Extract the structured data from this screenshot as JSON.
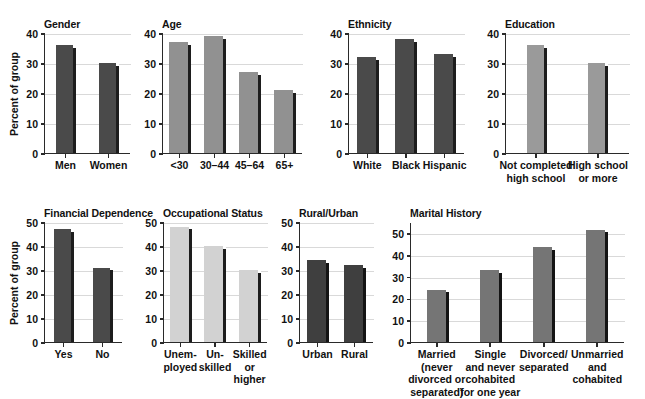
{
  "chart_data": [
    {
      "type": "bar",
      "title": "Gender",
      "xlabel": "",
      "ylabel": "Percent of group",
      "categories": [
        "Men",
        "Women"
      ],
      "values": [
        36,
        30
      ],
      "ylim": [
        0,
        40
      ],
      "yticks": [
        0,
        10,
        20,
        30,
        40
      ],
      "grid": true,
      "legend": "none",
      "bar_color": "#4a4a4a",
      "bar_shadow_color": "#1d1d1d"
    },
    {
      "type": "bar",
      "title": "Age",
      "xlabel": "",
      "ylabel": "",
      "categories": [
        "<30",
        "30–44",
        "45–64",
        "65+"
      ],
      "values": [
        37,
        39,
        27,
        21
      ],
      "ylim": [
        0,
        40
      ],
      "yticks": [
        0,
        10,
        20,
        30,
        40
      ],
      "grid": true,
      "legend": "none",
      "bar_color": "#919191",
      "bar_shadow_color": "#1d1d1d"
    },
    {
      "type": "bar",
      "title": "Ethnicity",
      "xlabel": "",
      "ylabel": "",
      "categories": [
        "White",
        "Black",
        "Hispanic"
      ],
      "values": [
        32,
        38,
        33
      ],
      "ylim": [
        0,
        40
      ],
      "yticks": [
        0,
        10,
        20,
        30,
        40
      ],
      "grid": true,
      "legend": "none",
      "bar_color": "#4a4a4a",
      "bar_shadow_color": "#1d1d1d"
    },
    {
      "type": "bar",
      "title": "Education",
      "xlabel": "",
      "ylabel": "",
      "categories": [
        "Not completed\nhigh school",
        "High school\nor more"
      ],
      "values": [
        36,
        30
      ],
      "ylim": [
        0,
        40
      ],
      "yticks": [
        0,
        10,
        20,
        30,
        40
      ],
      "grid": true,
      "legend": "none",
      "bar_color": "#9a9a9a",
      "bar_shadow_color": "#1d1d1d"
    },
    {
      "type": "bar",
      "title": "Financial Dependence",
      "xlabel": "",
      "ylabel": "Percent of group",
      "categories": [
        "Yes",
        "No"
      ],
      "values": [
        47,
        31
      ],
      "ylim": [
        0,
        50
      ],
      "yticks": [
        0,
        10,
        20,
        30,
        40,
        50
      ],
      "grid": true,
      "legend": "none",
      "bar_color": "#4a4a4a",
      "bar_shadow_color": "#1d1d1d"
    },
    {
      "type": "bar",
      "title": "Occupational Status",
      "xlabel": "",
      "ylabel": "",
      "categories": [
        "Unem-\nployed",
        "Un-\nskilled",
        "Skilled\nor\nhigher"
      ],
      "values": [
        48,
        40,
        30
      ],
      "ylim": [
        0,
        50
      ],
      "yticks": [
        0,
        10,
        20,
        30,
        40,
        50
      ],
      "grid": true,
      "legend": "none",
      "bar_color": "#d2d2d2",
      "bar_shadow_color": "#1d1d1d"
    },
    {
      "type": "bar",
      "title": "Rural/Urban",
      "xlabel": "",
      "ylabel": "",
      "categories": [
        "Urban",
        "Rural"
      ],
      "values": [
        34,
        32
      ],
      "ylim": [
        0,
        50
      ],
      "yticks": [
        0,
        10,
        20,
        30,
        40,
        50
      ],
      "grid": true,
      "legend": "none",
      "bar_color": "#3f3f3f",
      "bar_shadow_color": "#141414"
    },
    {
      "type": "bar",
      "title": "Marital History",
      "xlabel": "",
      "ylabel": "",
      "categories": [
        "Married\n(never\ndivorced or\nseparated)",
        "Single\nand never\ncohabited\nfor one year",
        "Divorced/\nseparated",
        "Unmarried\nand\ncohabited"
      ],
      "values": [
        24,
        33,
        43.5,
        51.5
      ],
      "ylim": [
        0,
        55
      ],
      "yticks": [
        0,
        10,
        20,
        30,
        40,
        50
      ],
      "grid": true,
      "legend": "none",
      "bar_color": "#757575",
      "bar_shadow_color": "#141414"
    }
  ],
  "layout": {
    "panels": [
      {
        "key": "gender",
        "x": 44,
        "y": 18,
        "plot_w": 86,
        "plot_h": 120,
        "bar_w": 20,
        "label_top": 6,
        "ylabel": true
      },
      {
        "key": "age",
        "x": 162,
        "y": 18,
        "plot_w": 140,
        "plot_h": 120,
        "bar_w": 22,
        "label_top": 6,
        "ylabel": false
      },
      {
        "key": "ethnicity",
        "x": 348,
        "y": 18,
        "plot_w": 116,
        "plot_h": 120,
        "bar_w": 22,
        "label_top": 6,
        "ylabel": false
      },
      {
        "key": "education",
        "x": 505,
        "y": 18,
        "plot_w": 124,
        "plot_h": 120,
        "bar_w": 20,
        "label_top": 6,
        "ylabel": false
      },
      {
        "key": "financial-dependence",
        "x": 44,
        "y": 207,
        "plot_w": 78,
        "plot_h": 120,
        "bar_w": 20,
        "label_top": 6,
        "ylabel": true
      },
      {
        "key": "occupational-status",
        "x": 163,
        "y": 207,
        "plot_w": 104,
        "plot_h": 120,
        "bar_w": 22,
        "label_top": 6,
        "ylabel": false
      },
      {
        "key": "rural-urban",
        "x": 299,
        "y": 207,
        "plot_w": 74,
        "plot_h": 120,
        "bar_w": 22,
        "label_top": 6,
        "ylabel": false
      },
      {
        "key": "marital-history",
        "x": 410,
        "y": 207,
        "plot_w": 214,
        "plot_h": 120,
        "bar_w": 22,
        "label_top": 6,
        "ylabel": false
      }
    ]
  }
}
